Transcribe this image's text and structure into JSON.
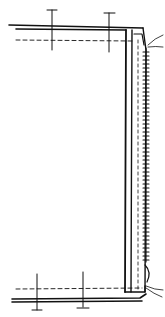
{
  "diagram": {
    "type": "sewing-construction-sketch",
    "colors": {
      "background": "#ffffff",
      "ink": "#111111"
    },
    "elements": {
      "top_layers": {
        "pins": 2,
        "stitch_line": "dashed"
      },
      "bottom_layers": {
        "pins": 2,
        "stitch_line": "dashed"
      },
      "vertical_edge": {
        "zipper_teeth": true,
        "stitch_line": "dashed",
        "thread_ends": 2
      }
    }
  }
}
